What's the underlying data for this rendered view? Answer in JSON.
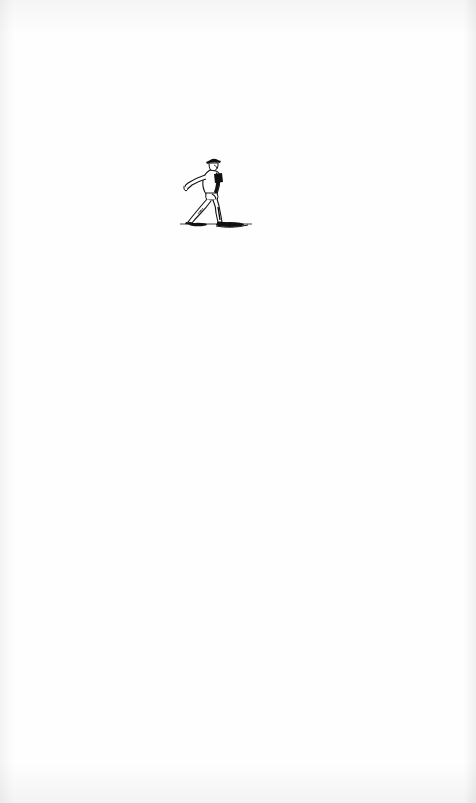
{
  "page": {
    "type": "scanned-book-page",
    "background_color": "#fefefe",
    "ink_color": "#111111"
  },
  "illustration": {
    "subject": "walking man in brimmed hat",
    "style": "woodcut vignette",
    "icon": "walking-figure-icon",
    "position": {
      "x": 176,
      "y": 156,
      "width": 80,
      "height": 76
    }
  }
}
